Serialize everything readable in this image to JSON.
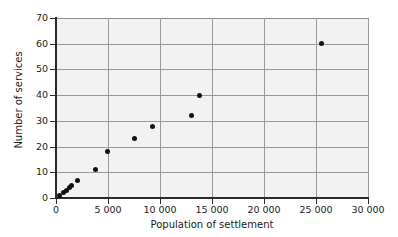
{
  "chart_data": {
    "type": "scatter",
    "title": "",
    "xlabel": "Population of settlement",
    "ylabel": "Number of services",
    "xlim": [
      0,
      30000
    ],
    "ylim": [
      0,
      70
    ],
    "grid": true,
    "legend": false,
    "x_ticks": [
      0,
      5000,
      10000,
      15000,
      20000,
      25000,
      30000
    ],
    "x_tick_labels": [
      "0",
      "5 000",
      "10 000",
      "15 000",
      "20 000",
      "25 000",
      "30 000"
    ],
    "y_ticks": [
      0,
      10,
      20,
      30,
      40,
      50,
      60,
      70
    ],
    "y_tick_labels": [
      "0",
      "10",
      "20",
      "30",
      "40",
      "50",
      "60",
      "70"
    ],
    "points": [
      {
        "x": 300,
        "y": 1
      },
      {
        "x": 700,
        "y": 2
      },
      {
        "x": 1000,
        "y": 3
      },
      {
        "x": 1250,
        "y": 4
      },
      {
        "x": 1450,
        "y": 5
      },
      {
        "x": 2100,
        "y": 7
      },
      {
        "x": 3800,
        "y": 11
      },
      {
        "x": 4950,
        "y": 18
      },
      {
        "x": 7550,
        "y": 23
      },
      {
        "x": 9300,
        "y": 28
      },
      {
        "x": 13000,
        "y": 32
      },
      {
        "x": 13800,
        "y": 40
      },
      {
        "x": 25500,
        "y": 60
      }
    ],
    "colors": {
      "marker": "#111111",
      "grid": "#9a9a9a",
      "axis": "#2b2b2b",
      "plot_background": "#f2f2f2",
      "page_background": "#ffffff"
    }
  }
}
